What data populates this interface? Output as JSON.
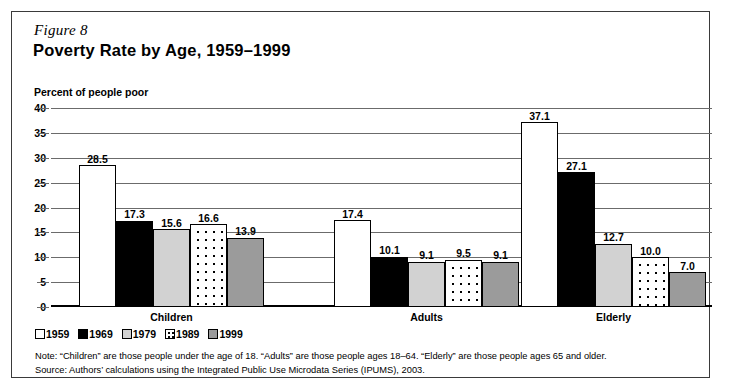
{
  "figure": {
    "number": "Figure 8",
    "title": "Poverty Rate by Age, 1959–1999",
    "axis_note": "Percent of people poor"
  },
  "footnotes": {
    "note": "Note: “Children” are those people under the age of 18. “Adults” are those people ages 18–64. “Elderly” are those people ages 65 and older.",
    "source": "Source: Authors’ calculations using the Integrated Public Use Microdata Series (IPUMS), 2003."
  },
  "legend": {
    "items": [
      {
        "label": "1959",
        "swatch": "white-swatch",
        "color": "#ffffff"
      },
      {
        "label": "1969",
        "swatch": "black-swatch",
        "color": "#000000"
      },
      {
        "label": "1979",
        "swatch": "light-gray-swatch",
        "color": "#d2d2d2"
      },
      {
        "label": "1989",
        "swatch": "dotted-swatch",
        "color": "#ffffff"
      },
      {
        "label": "1999",
        "swatch": "medium-gray-swatch",
        "color": "#9b9b9b"
      }
    ]
  },
  "chart_data": {
    "type": "bar",
    "title": "Poverty Rate by Age, 1959–1999",
    "xlabel": "",
    "ylabel": "Percent of people poor",
    "ylim": [
      0,
      40
    ],
    "yticks": [
      0,
      5,
      10,
      15,
      20,
      25,
      30,
      35,
      40
    ],
    "grid": true,
    "legend_position": "below-plot-left",
    "categories": [
      "Children",
      "Adults",
      "Elderly"
    ],
    "series": [
      {
        "name": "1959",
        "values": [
          28.5,
          17.4,
          37.1
        ]
      },
      {
        "name": "1969",
        "values": [
          17.3,
          10.1,
          27.1
        ]
      },
      {
        "name": "1979",
        "values": [
          15.6,
          9.1,
          12.7
        ]
      },
      {
        "name": "1989",
        "values": [
          16.6,
          9.5,
          10.0
        ]
      },
      {
        "name": "1999",
        "values": [
          13.9,
          9.1,
          7.0
        ]
      }
    ],
    "value_labels": {
      "Children": [
        "28.5",
        "17.3",
        "15.6",
        "16.6",
        "13.9"
      ],
      "Adults": [
        "17.4",
        "10.1",
        "9.1",
        "9.5",
        "9.1"
      ],
      "Elderly": [
        "37.1",
        "27.1",
        "12.7",
        "10.0",
        "7.0"
      ]
    }
  }
}
